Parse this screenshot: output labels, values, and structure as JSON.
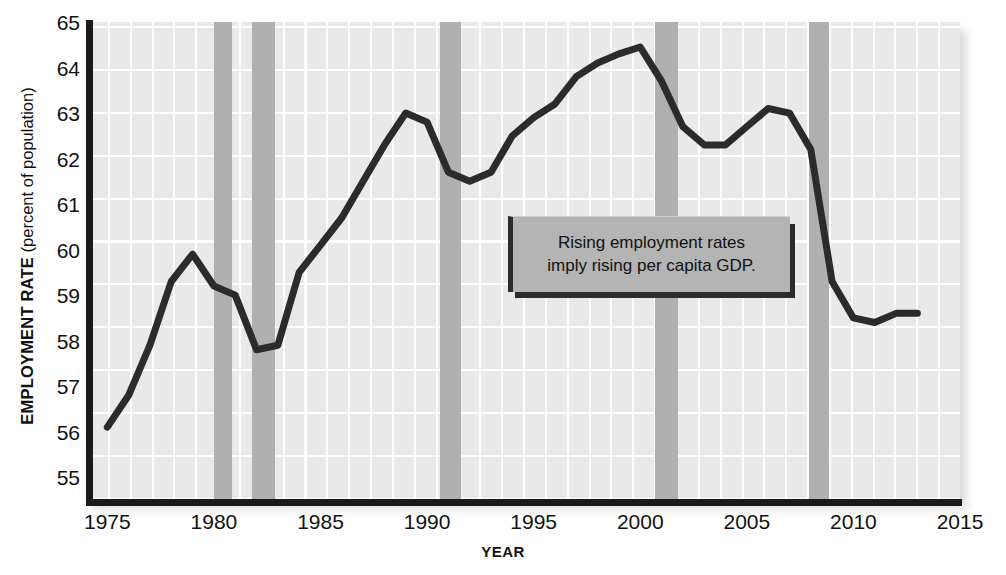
{
  "chart_data": {
    "type": "line",
    "title": "",
    "xlabel": "YEAR",
    "ylabel": "EMPLOYMENT RATE (percent of population)",
    "ylabel_strong": "EMPLOYMENT RATE",
    "ylabel_light": "(percent of population)",
    "xlim": [
      1974,
      2015
    ],
    "ylim": [
      54.5,
      65
    ],
    "xticks": [
      1975,
      1980,
      1985,
      1990,
      1995,
      2000,
      2005,
      2010,
      2015
    ],
    "yticks": [
      55,
      56,
      57,
      58,
      59,
      60,
      61,
      62,
      63,
      64,
      65
    ],
    "grid": true,
    "legend": "none",
    "line_color": "#2b2b2b",
    "plot_bg_color": "#e9e9e9",
    "grid_color": "#ffffff",
    "recession_color": "#b0b0b0",
    "series": [
      {
        "name": "Employment rate",
        "x": [
          1975,
          1976,
          1977,
          1978,
          1979,
          1980,
          1981,
          1982,
          1983,
          1984,
          1985,
          1986,
          1987,
          1988,
          1989,
          1990,
          1991,
          1992,
          1993,
          1994,
          1995,
          1996,
          1997,
          1998,
          1999,
          2000,
          2001,
          2002,
          2003,
          2004,
          2005,
          2006,
          2007,
          2008,
          2009,
          2010,
          2011,
          2012,
          2013
        ],
        "y": [
          56.1,
          56.8,
          57.9,
          59.3,
          59.9,
          59.2,
          59.0,
          57.8,
          57.9,
          59.5,
          60.1,
          60.7,
          61.5,
          62.3,
          63.0,
          62.8,
          61.7,
          61.5,
          61.7,
          62.5,
          62.9,
          63.2,
          63.8,
          64.1,
          64.3,
          64.45,
          63.7,
          62.7,
          62.3,
          62.3,
          62.7,
          63.1,
          63.0,
          62.2,
          59.3,
          58.5,
          58.4,
          58.6,
          58.6
        ]
      }
    ],
    "recession_bands": [
      {
        "label": "1980 recession",
        "start": 1980.0,
        "end": 1980.85
      },
      {
        "label": "1981-82 recession",
        "start": 1981.8,
        "end": 1982.85
      },
      {
        "label": "1990-91 recession",
        "start": 1990.6,
        "end": 1991.6
      },
      {
        "label": "2001 recession",
        "start": 2000.7,
        "end": 2001.75
      },
      {
        "label": "2007-09 recession",
        "start": 2007.9,
        "end": 2008.85
      }
    ],
    "annotations": [
      {
        "name": "callout",
        "line1": "Rising employment rates",
        "line2": "imply rising per capita GDP.",
        "text": "Rising employment rates imply rising per capita GDP."
      }
    ]
  }
}
